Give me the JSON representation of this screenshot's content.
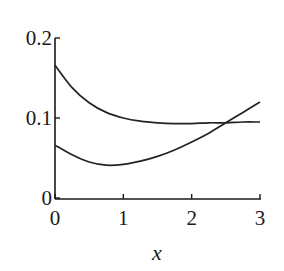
{
  "chart_data": {
    "type": "line",
    "title": "",
    "xlabel": "x",
    "ylabel": "",
    "xlim": [
      0,
      3
    ],
    "ylim": [
      0,
      0.2
    ],
    "xticks": [
      0,
      1,
      2,
      3
    ],
    "xtick_labels": [
      "0",
      "1",
      "2",
      "3"
    ],
    "yticks": [
      0,
      0.1,
      0.2
    ],
    "ytick_labels": [
      "0",
      "0.1",
      "0.2"
    ],
    "grid": false,
    "legend": null,
    "series": [
      {
        "name": "upper curve",
        "x": [
          0,
          0.25,
          0.5,
          0.75,
          1.0,
          1.25,
          1.5,
          1.75,
          2.0,
          2.25,
          2.5,
          2.75,
          3.0
        ],
        "values": [
          0.166,
          0.138,
          0.119,
          0.107,
          0.1,
          0.096,
          0.094,
          0.093,
          0.093,
          0.094,
          0.094,
          0.095,
          0.095
        ]
      },
      {
        "name": "lower curve",
        "x": [
          0,
          0.25,
          0.5,
          0.75,
          1.0,
          1.25,
          1.5,
          1.75,
          2.0,
          2.25,
          2.5,
          2.75,
          3.0
        ],
        "values": [
          0.066,
          0.054,
          0.045,
          0.041,
          0.042,
          0.046,
          0.052,
          0.06,
          0.07,
          0.081,
          0.094,
          0.107,
          0.12
        ]
      }
    ]
  }
}
